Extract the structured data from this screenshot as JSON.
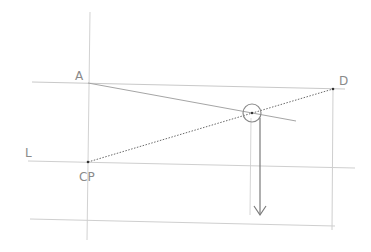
{
  "diagram": {
    "type": "perspective-construction",
    "colors": {
      "background": "#ffffff",
      "guide_line": "#cfcfcf",
      "construction_line": "#9a9a9a",
      "dotted_line": "#6a6a6a",
      "arrow": "#7a7a7a",
      "label": "#8a8a8a"
    },
    "labels": {
      "A": "A",
      "D": "D",
      "L": "L",
      "CP": "CP"
    },
    "points": {
      "A": {
        "x": 88,
        "y": 83
      },
      "D": {
        "x": 333,
        "y": 89
      },
      "CP": {
        "x": 88,
        "y": 162
      },
      "intersection": {
        "x": 252,
        "y": 113
      }
    }
  }
}
